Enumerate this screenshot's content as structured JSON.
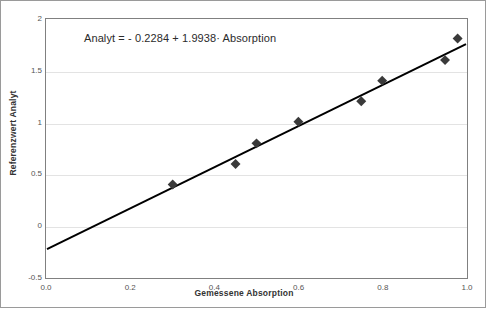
{
  "chart_data": {
    "type": "scatter",
    "title": "",
    "xlabel": "Gemessene Absorption",
    "ylabel": "Referenzwert Analyt",
    "xlim": [
      0.0,
      1.0
    ],
    "ylim": [
      -0.5,
      2.0
    ],
    "grid": true,
    "legend": "none",
    "annotation": "Analyt = - 0.2284 + 1.9938· Absorption",
    "fit": {
      "type": "linear",
      "intercept": -0.2284,
      "slope": 1.9938,
      "color": "#000000"
    },
    "marker": {
      "shape": "diamond",
      "color": "#3a3a3a",
      "size": 5
    },
    "x": [
      0.3,
      0.45,
      0.5,
      0.6,
      0.75,
      0.8,
      0.95,
      0.98
    ],
    "y": [
      0.4,
      0.6,
      0.8,
      1.01,
      1.21,
      1.41,
      1.61,
      1.82
    ],
    "points": [
      {
        "x": 0.3,
        "y": 0.4
      },
      {
        "x": 0.45,
        "y": 0.6
      },
      {
        "x": 0.5,
        "y": 0.8
      },
      {
        "x": 0.6,
        "y": 1.01
      },
      {
        "x": 0.75,
        "y": 1.21
      },
      {
        "x": 0.8,
        "y": 1.41
      },
      {
        "x": 0.95,
        "y": 1.61
      },
      {
        "x": 0.98,
        "y": 1.82
      }
    ],
    "xticks": [
      {
        "value": 0.0,
        "label": "0.0"
      },
      {
        "value": 0.2,
        "label": "0.2"
      },
      {
        "value": 0.4,
        "label": "0.4"
      },
      {
        "value": 0.6,
        "label": "0.6"
      },
      {
        "value": 0.8,
        "label": "0.8"
      },
      {
        "value": 1.0,
        "label": "1.0"
      }
    ],
    "yticks": [
      {
        "value": 2.0,
        "label": "2"
      },
      {
        "value": 1.5,
        "label": "1.5"
      },
      {
        "value": 1.0,
        "label": "1"
      },
      {
        "value": 0.5,
        "label": "0.5"
      },
      {
        "value": 0.0,
        "label": "0"
      },
      {
        "value": -0.5,
        "label": "-0.5"
      }
    ]
  },
  "colors": {
    "marker": "#3a3a3a",
    "fit_line": "#000000",
    "grid": "#e3e3e3",
    "axis": "#808080",
    "frame": "#9a9a9a",
    "tick_text": "#555555",
    "title_text": "#333333"
  }
}
